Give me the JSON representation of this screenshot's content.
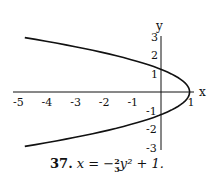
{
  "chart_data": {
    "type": "line",
    "xlabel": "x",
    "ylabel": "y",
    "xlim": [
      -5,
      1
    ],
    "ylim": [
      -3,
      3
    ],
    "x_ticks": [
      "-5",
      "-4",
      "-3",
      "-2",
      "-1",
      "1"
    ],
    "y_ticks": [
      "3",
      "2",
      "1",
      "-1",
      "-2",
      "-3"
    ],
    "grid": false,
    "series": [
      {
        "name": "x = -2/3 y^2 + 1",
        "points": [
          {
            "y": -2.94,
            "x": -4.77
          },
          {
            "y": -2.5,
            "x": -3.17
          },
          {
            "y": -2,
            "x": -1.67
          },
          {
            "y": -1.5,
            "x": -0.5
          },
          {
            "y": -1.22,
            "x": 0
          },
          {
            "y": -1,
            "x": 0.33
          },
          {
            "y": -0.5,
            "x": 0.83
          },
          {
            "y": 0,
            "x": 1
          },
          {
            "y": 0.5,
            "x": 0.83
          },
          {
            "y": 1,
            "x": 0.33
          },
          {
            "y": 1.22,
            "x": 0
          },
          {
            "y": 1.5,
            "x": -0.5
          },
          {
            "y": 2,
            "x": -1.67
          },
          {
            "y": 2.5,
            "x": -3.17
          },
          {
            "y": 2.94,
            "x": -4.77
          }
        ]
      }
    ]
  },
  "caption": {
    "number": "37.",
    "lhs": "x = −",
    "frac_num": "2",
    "frac_den": "3",
    "rhs": "y² + 1."
  }
}
